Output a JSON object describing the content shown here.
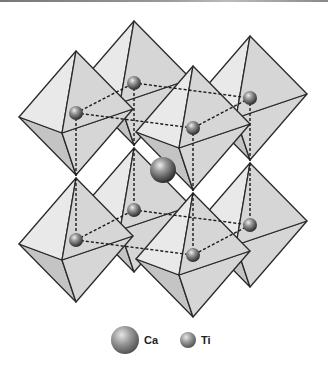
{
  "figure": {
    "legend": [
      {
        "key": "ca",
        "label": "Ca"
      },
      {
        "key": "ti",
        "label": "Ti"
      }
    ]
  },
  "colors": {
    "face_light": "#e9e9e9",
    "face_mid": "#d6d6d6",
    "face_dark": "#c4c4c4",
    "edge": "#2a2a2a",
    "bond": "#1a1a1a"
  },
  "structure": {
    "ti_sites": [
      {
        "id": "ti-top-back",
        "x": 134,
        "y": 83
      },
      {
        "id": "ti-top-right",
        "x": 250,
        "y": 98
      },
      {
        "id": "ti-top-left",
        "x": 76,
        "y": 113
      },
      {
        "id": "ti-top-front",
        "x": 193,
        "y": 128
      },
      {
        "id": "ti-bot-back",
        "x": 134,
        "y": 210
      },
      {
        "id": "ti-bot-right",
        "x": 250,
        "y": 225
      },
      {
        "id": "ti-bot-left",
        "x": 76,
        "y": 240
      },
      {
        "id": "ti-bot-front",
        "x": 193,
        "y": 255
      }
    ],
    "ca_site": {
      "x": 163,
      "y": 170
    }
  }
}
